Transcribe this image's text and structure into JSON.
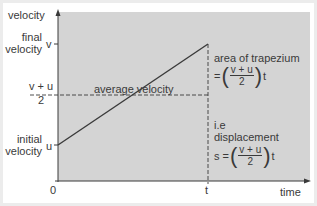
{
  "diagram": {
    "type": "velocity-time graph",
    "colors": {
      "frame": "#ececec",
      "panel": "#ffffff",
      "plot_fill": "#d4d4d4",
      "line": "#3a3a3a"
    },
    "axes": {
      "y_label": "velocity",
      "x_label": "time",
      "origin": "0"
    },
    "y_ticks": {
      "final_label_line1": "final",
      "final_label_line2": "velocity",
      "final_symbol": "v",
      "avg_numerator": "v + u",
      "avg_denominator": "2",
      "initial_label_line1": "initial",
      "initial_label_line2": "velocity",
      "initial_symbol": "u"
    },
    "x_ticks": {
      "t_symbol": "t"
    },
    "annotations": {
      "average_velocity": "average velocity",
      "area_title": "area of trapezium",
      "area_eq_prefix": "=",
      "area_num": "v + u",
      "area_den": "2",
      "area_suffix": "t",
      "ie_label": "i.e",
      "displacement_label": "displacement",
      "disp_prefix": "s =",
      "disp_num": "v + u",
      "disp_den": "2",
      "disp_suffix": "t"
    }
  }
}
